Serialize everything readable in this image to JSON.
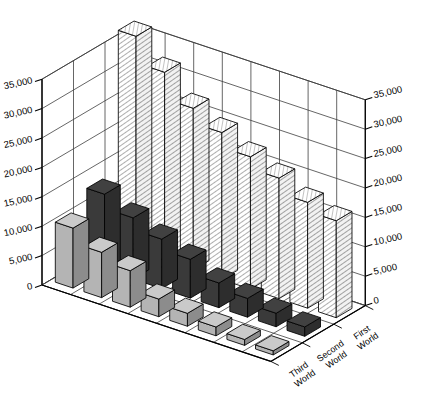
{
  "chart_data": {
    "type": "bar",
    "title": "",
    "subtitle": "",
    "xlabel": "",
    "ylabel": "",
    "zlabel": "",
    "projection": "3d-isometric",
    "grid": true,
    "legend_position": "none",
    "ylim": [
      0,
      35000
    ],
    "ytick_values": [
      0,
      5000,
      10000,
      15000,
      20000,
      25000,
      30000,
      35000
    ],
    "ytick_labels": [
      "0",
      "5,000",
      "10,000",
      "15,000",
      "20,000",
      "25,000",
      "30,000",
      "35,000"
    ],
    "left_axis_labels": [
      "35,000",
      "30,000",
      "25,000",
      "20,000",
      "15,000",
      "10,000",
      "5,000",
      "0"
    ],
    "right_axis_labels": [
      "35,000",
      "30,000",
      "25,000",
      "20,000",
      "15,000",
      "10,000",
      "5,000",
      "0"
    ],
    "categories": [
      "1",
      "2",
      "3",
      "4",
      "5",
      "6",
      "7",
      "8"
    ],
    "depth_categories": [
      "Third World",
      "Second World",
      "First World"
    ],
    "series": [
      {
        "name": "Third World",
        "fill": "#b4b4b4",
        "pattern": "solid",
        "values": [
          10200,
          7700,
          6200,
          3000,
          2200,
          1500,
          1000,
          700
        ]
      },
      {
        "name": "Second World",
        "fill": "#3a3a3a",
        "pattern": "solid",
        "values": [
          12800,
          10400,
          8400,
          6600,
          4200,
          3200,
          2300,
          1600
        ]
      },
      {
        "name": "First World",
        "fill": "#ffffff",
        "pattern": "diagonal-hatch",
        "values": [
          36500,
          32000,
          27500,
          25000,
          22500,
          20500,
          18000,
          16500
        ]
      }
    ]
  },
  "colors": {
    "background": "#ffffff",
    "axis_line": "#000000",
    "grid_line": "#3f3f3f",
    "wall_fill": "#ffffff",
    "floor_fill": "#ffffff",
    "series_third_world": "#b4b4b4",
    "series_second_world": "#3a3a3a",
    "series_first_world": "#ffffff",
    "hatch_stroke": "#555555"
  }
}
